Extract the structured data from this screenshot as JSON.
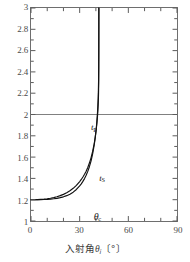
{
  "chart_data": {
    "type": "line",
    "title": "",
    "subtitle": "",
    "xlabel": "入射角 θi 〔°〕",
    "ylabel": "",
    "xlim": [
      0,
      90
    ],
    "ylim": [
      1,
      3
    ],
    "grid": false,
    "legend_position": "inline-annotation",
    "x_ticks_major": [
      0,
      30,
      60,
      90
    ],
    "x_ticks_major_labels": [
      "0",
      "30",
      "60",
      "90"
    ],
    "x_ticks_minor_step": 10,
    "y_ticks_major": [
      1,
      1.2,
      1.4,
      1.6,
      1.8,
      2,
      2.2,
      2.4,
      2.6,
      2.8,
      3
    ],
    "y_ticks_major_labels": [
      "1",
      "1.2",
      "1.4",
      "1.6",
      "1.8",
      "2",
      "2.2",
      "2.4",
      "2.6",
      "2.8",
      "3"
    ],
    "reference_lines": [
      {
        "name": "y-equals-2-line",
        "orientation": "horizontal",
        "value": 2,
        "color": "#808080"
      }
    ],
    "critical_angle_deg": 41.8,
    "series": [
      {
        "name": "t_P",
        "label": "tP",
        "label_main": "t",
        "label_sub": "P",
        "color": "#111111",
        "x": [
          0,
          2,
          4,
          6,
          8,
          10,
          12,
          14,
          16,
          18,
          20,
          22,
          24,
          26,
          28,
          30,
          31,
          32,
          33,
          34,
          35,
          36,
          37,
          38,
          39,
          39.6,
          40.2,
          40.6,
          41,
          41.2,
          41.4,
          41.55,
          41.65,
          41.72,
          41.76,
          41.79,
          41.81
        ],
        "y": [
          1.2,
          1.2,
          1.201,
          1.203,
          1.205,
          1.209,
          1.214,
          1.22,
          1.228,
          1.238,
          1.25,
          1.265,
          1.284,
          1.307,
          1.335,
          1.37,
          1.39,
          1.413,
          1.439,
          1.468,
          1.503,
          1.544,
          1.593,
          1.653,
          1.73,
          1.788,
          1.858,
          1.915,
          1.985,
          2.03,
          2.09,
          2.15,
          2.21,
          2.29,
          2.41,
          2.63,
          3.0
        ]
      },
      {
        "name": "t_S",
        "label": "tS",
        "label_main": "t",
        "label_sub": "S",
        "color": "#111111",
        "x": [
          0,
          2,
          4,
          6,
          8,
          10,
          12,
          14,
          16,
          18,
          20,
          22,
          24,
          26,
          28,
          30,
          31,
          32,
          33,
          34,
          35,
          36,
          37,
          38,
          39,
          39.6,
          40.2,
          40.6,
          41,
          41.2,
          41.4,
          41.55,
          41.68,
          41.76,
          41.8,
          41.83,
          41.85
        ],
        "y": [
          1.2,
          1.2,
          1.2005,
          1.2012,
          1.2022,
          1.2037,
          1.206,
          1.209,
          1.213,
          1.219,
          1.227,
          1.238,
          1.252,
          1.271,
          1.296,
          1.329,
          1.349,
          1.372,
          1.398,
          1.429,
          1.466,
          1.51,
          1.563,
          1.63,
          1.717,
          1.783,
          1.865,
          1.932,
          2.02,
          2.08,
          2.15,
          2.23,
          2.33,
          2.46,
          2.6,
          2.8,
          3.0
        ]
      }
    ],
    "annotations": [
      {
        "name": "t-p-label",
        "text": "tP",
        "x": 36.5,
        "y": 1.93
      },
      {
        "name": "t-s-label",
        "text": "tS",
        "x": 41.5,
        "y": 1.46
      },
      {
        "name": "critical-angle-label",
        "text": "θc",
        "x": 41.8,
        "y": 1.105
      }
    ]
  },
  "axis": {
    "x_title_prefix": "入射角",
    "x_title_symbol": "θ",
    "x_title_subscript": "i",
    "x_title_unit_open": "〔",
    "x_title_unit": "°",
    "x_title_unit_close": "〕"
  },
  "labels": {
    "tp_main": "t",
    "tp_sub": "P",
    "ts_main": "t",
    "ts_sub": "S",
    "theta_main": "θ",
    "theta_sub": "c"
  },
  "colors": {
    "frame": "#6e6e6e",
    "curve": "#111111",
    "reference_line": "#808080",
    "tick_text": "#4a4a4a",
    "background": "#ffffff"
  }
}
